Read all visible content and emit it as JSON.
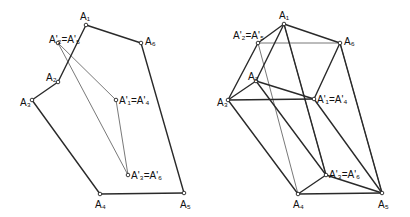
{
  "figures": [
    {
      "id": "left",
      "points": {
        "A1": {
          "x": 86,
          "y": 25,
          "label": "A₁",
          "lx": 80,
          "ly": 20
        },
        "A6": {
          "x": 141,
          "y": 43,
          "label": "A₆",
          "lx": 145,
          "ly": 45
        },
        "A5": {
          "x": 184,
          "y": 193,
          "label": "A₅",
          "lx": 180,
          "ly": 208
        },
        "A4": {
          "x": 100,
          "y": 194,
          "label": "A₄",
          "lx": 95,
          "ly": 208
        },
        "A3": {
          "x": 32,
          "y": 100,
          "label": "A₃",
          "lx": 20,
          "ly": 106
        },
        "A2": {
          "x": 58,
          "y": 82,
          "label": "A₂",
          "lx": 46,
          "ly": 81
        },
        "A2p": {
          "x": 58,
          "y": 43,
          "label": "A'₂=A'₅",
          "lx": 49,
          "ly": 43
        },
        "A1p": {
          "x": 116,
          "y": 100,
          "label": "A'₁=A'₄",
          "lx": 119,
          "ly": 104
        },
        "A3p": {
          "x": 128,
          "y": 175,
          "label": "A'₃=A'₆",
          "lx": 131,
          "ly": 179
        }
      },
      "thick_edges": [
        [
          "A1",
          "A6"
        ],
        [
          "A6",
          "A5"
        ],
        [
          "A5",
          "A4"
        ],
        [
          "A4",
          "A3"
        ],
        [
          "A3",
          "A2"
        ],
        [
          "A2",
          "A1"
        ]
      ],
      "thin_edges": [
        [
          "A2p",
          "A1p"
        ],
        [
          "A1p",
          "A3p"
        ],
        [
          "A2p",
          "A3p"
        ]
      ]
    },
    {
      "id": "right",
      "points": {
        "A1": {
          "x": 284,
          "y": 24,
          "label": "A₁",
          "lx": 279,
          "ly": 19
        },
        "A6": {
          "x": 340,
          "y": 43,
          "label": "A₆",
          "lx": 344,
          "ly": 45
        },
        "A5": {
          "x": 382,
          "y": 193,
          "label": "A₅",
          "lx": 378,
          "ly": 208
        },
        "A4": {
          "x": 298,
          "y": 194,
          "label": "A₄",
          "lx": 293,
          "ly": 208
        },
        "A3": {
          "x": 228,
          "y": 100,
          "label": "A₃",
          "lx": 217,
          "ly": 106
        },
        "A2": {
          "x": 256,
          "y": 81,
          "label": "A₂",
          "lx": 248,
          "ly": 80
        },
        "A2p": {
          "x": 258,
          "y": 43,
          "label": "A'₂=A'₅",
          "lx": 233,
          "ly": 39
        },
        "A1p": {
          "x": 314,
          "y": 99,
          "label": "A'₁=A'₄",
          "lx": 317,
          "ly": 103
        },
        "A3p": {
          "x": 326,
          "y": 175,
          "label": "A'₃=A'₆",
          "lx": 329,
          "ly": 178
        }
      },
      "thick_edges": [
        [
          "A1",
          "A6"
        ],
        [
          "A6",
          "A5"
        ],
        [
          "A5",
          "A4"
        ],
        [
          "A4",
          "A3"
        ],
        [
          "A3",
          "A2"
        ],
        [
          "A2",
          "A1"
        ],
        [
          "A1",
          "A2p"
        ],
        [
          "A2p",
          "A3"
        ],
        [
          "A1",
          "A3p"
        ],
        [
          "A2",
          "A1p"
        ],
        [
          "A2",
          "A3p"
        ],
        [
          "A6",
          "A1p"
        ],
        [
          "A1p",
          "A5"
        ],
        [
          "A3p",
          "A4"
        ],
        [
          "A3p",
          "A5"
        ],
        [
          "A3",
          "A1p"
        ]
      ],
      "thin_edges": [
        [
          "A2p",
          "A6"
        ],
        [
          "A2p",
          "A4"
        ],
        [
          "A1",
          "A3p"
        ],
        [
          "A6",
          "A5"
        ]
      ]
    }
  ]
}
